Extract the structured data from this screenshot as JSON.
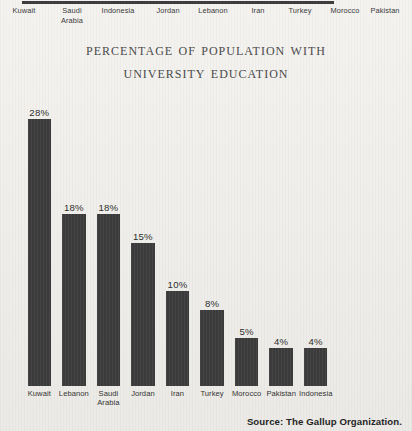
{
  "top_strip": {
    "labels": [
      "Kuwait",
      "Saudi\nArabia",
      "Indonesia",
      "Jordan",
      "Lebanon",
      "Iran",
      "Turkey",
      "Morocco",
      "Pakistan"
    ]
  },
  "title": {
    "line1": "Percentage of Population with",
    "line2": "University Education"
  },
  "source": "Source: The Gallup Organization.",
  "colors": {
    "bar": "#3b3b3b",
    "paper": "#f1f0ec",
    "title": "#4a4a4a",
    "text": "#2b2b2b"
  },
  "chart_data": {
    "type": "bar",
    "title": "Percentage of Population with University Education",
    "xlabel": "",
    "ylabel": "",
    "ylim": [
      0,
      30
    ],
    "grid": false,
    "legend": null,
    "categories": [
      "Kuwait",
      "Lebanon",
      "Saudi Arabia",
      "Jordan",
      "Iran",
      "Turkey",
      "Morocco",
      "Pakistan",
      "Indonesia"
    ],
    "values": [
      28,
      18,
      18,
      15,
      10,
      8,
      5,
      4,
      4
    ],
    "value_labels": [
      "28%",
      "18%",
      "18%",
      "15%",
      "10%",
      "8%",
      "5%",
      "4%",
      "4%"
    ],
    "tick_labels": [
      "Kuwait",
      "Lebanon",
      "Saudi\nArabia",
      "Jordan",
      "Iran",
      "Turkey",
      "Morocco",
      "Pakistan",
      "Indonesia"
    ],
    "source": "Source: The Gallup Organization."
  }
}
